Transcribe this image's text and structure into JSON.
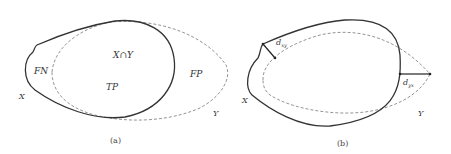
{
  "panels": [
    {
      "caption": "(a)",
      "labels": {
        "fn": "FN",
        "intersection": "X∩Y",
        "tp": "TP",
        "fp": "FP",
        "x": "X",
        "y": "Y"
      }
    },
    {
      "caption": "(b)",
      "labels": {
        "x": "X",
        "y": "Y",
        "d_left": "d",
        "d_left_sub": "xy",
        "d_right": "d",
        "d_right_sub": "yx"
      }
    }
  ],
  "colors": {
    "solid_curve": "#333333",
    "dashed_curve": "#888888",
    "text": "#333333"
  }
}
